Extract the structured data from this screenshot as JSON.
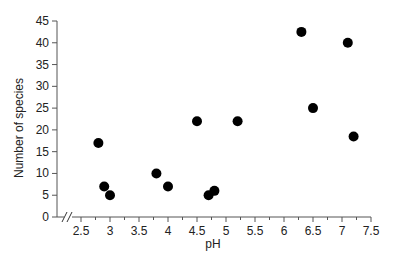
{
  "chart_data": {
    "type": "scatter",
    "title": "",
    "xlabel": "pH",
    "ylabel": "Number of species",
    "xlim": [
      2.2,
      7.5
    ],
    "ylim": [
      0,
      45
    ],
    "x_ticks": [
      2.5,
      3,
      3.5,
      4,
      4.5,
      5,
      5.5,
      6,
      6.5,
      7,
      7.5
    ],
    "x_tick_labels": [
      "2.5",
      "3",
      "3.5",
      "4",
      "4.5",
      "5",
      "5.5",
      "6",
      "6.5",
      "7",
      "7.5"
    ],
    "x_minor_ticks": [
      2.75,
      3.25,
      3.75,
      4.25,
      4.75,
      5.25,
      5.75,
      6.25,
      6.75,
      7.25
    ],
    "y_ticks": [
      0,
      5,
      10,
      15,
      20,
      25,
      30,
      35,
      40,
      45
    ],
    "y_tick_labels": [
      "0",
      "5",
      "10",
      "15",
      "20",
      "25",
      "30",
      "35",
      "40",
      "45"
    ],
    "axis_break": "x-axis break marks (//) near origin",
    "grid": false,
    "legend": null,
    "marker_color": "#000000",
    "series": [
      {
        "name": "species",
        "points": [
          {
            "x": 2.8,
            "y": 17
          },
          {
            "x": 2.9,
            "y": 7
          },
          {
            "x": 3.0,
            "y": 5
          },
          {
            "x": 3.8,
            "y": 10
          },
          {
            "x": 4.0,
            "y": 7
          },
          {
            "x": 4.5,
            "y": 22
          },
          {
            "x": 4.7,
            "y": 5
          },
          {
            "x": 4.8,
            "y": 6
          },
          {
            "x": 5.2,
            "y": 22
          },
          {
            "x": 6.3,
            "y": 42.5
          },
          {
            "x": 6.5,
            "y": 25
          },
          {
            "x": 7.1,
            "y": 40
          },
          {
            "x": 7.2,
            "y": 18.5
          }
        ]
      }
    ]
  }
}
